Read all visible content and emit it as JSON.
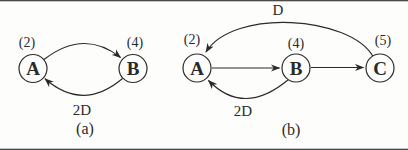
{
  "figure": {
    "background": "#fdfdfc",
    "ink": "#2a2a2a",
    "rule_color": "#4a4a4a",
    "diagrams": [
      {
        "caption": "(a)",
        "nodes": [
          {
            "label": "A",
            "weight": "(2)"
          },
          {
            "label": "B",
            "weight": "(4)"
          }
        ],
        "edges": [
          {
            "from": "A",
            "to": "B",
            "label": "",
            "shape": "curve-top"
          },
          {
            "from": "B",
            "to": "A",
            "label": "2D",
            "shape": "curve-bottom"
          }
        ]
      },
      {
        "caption": "(b)",
        "nodes": [
          {
            "label": "A",
            "weight": "(2)"
          },
          {
            "label": "B",
            "weight": "(4)"
          },
          {
            "label": "C",
            "weight": "(5)"
          }
        ],
        "edges": [
          {
            "from": "A",
            "to": "B",
            "label": "",
            "shape": "straight"
          },
          {
            "from": "B",
            "to": "C",
            "label": "",
            "shape": "straight"
          },
          {
            "from": "C",
            "to": "A",
            "label": "D",
            "shape": "curve-top"
          },
          {
            "from": "B",
            "to": "A",
            "label": "2D",
            "shape": "curve-bottom"
          }
        ]
      }
    ]
  }
}
